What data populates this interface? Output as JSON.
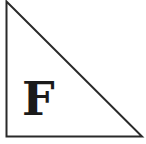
{
  "diagram": {
    "shape": "right-triangle",
    "vertices": {
      "apex": [
        6,
        1
      ],
      "right_angle": [
        6,
        137
      ],
      "bottom_right": [
        142,
        137
      ]
    },
    "stroke_color": "#2a2a2a",
    "fill_color": "#ffffff",
    "label": "F"
  }
}
